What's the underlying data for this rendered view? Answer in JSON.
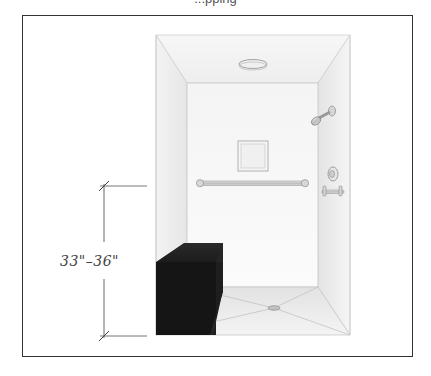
{
  "figure": {
    "caption_fragment": "...pping",
    "dimension": {
      "label": "33″–36″",
      "display": "33\"–36\"",
      "meaning": "grab bar height range above floor"
    },
    "elements": [
      {
        "name": "ceiling-light",
        "type": "fixture"
      },
      {
        "name": "shower-head",
        "type": "fixture"
      },
      {
        "name": "recessed-niche",
        "type": "fixture"
      },
      {
        "name": "horizontal-grab-bar",
        "type": "fixture"
      },
      {
        "name": "valve-control",
        "type": "fixture"
      },
      {
        "name": "side-grab-bar",
        "type": "fixture"
      },
      {
        "name": "bench-seat",
        "type": "furniture"
      },
      {
        "name": "center-floor-drain",
        "type": "fixture"
      }
    ],
    "colors": {
      "frame": "#333333",
      "wall": "#f2f2f2",
      "ceiling": "#f6f6f6",
      "bench": "#1a1a1a",
      "line": "#666666"
    }
  }
}
